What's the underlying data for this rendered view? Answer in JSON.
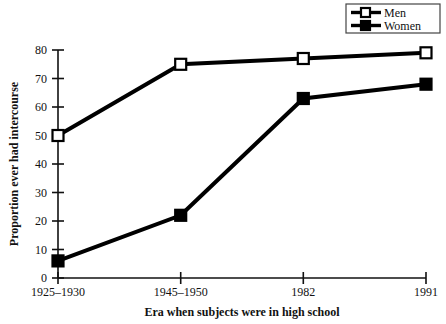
{
  "chart_data": {
    "type": "line",
    "title": "",
    "subtitle": "",
    "xlabel": "Era when subjects were in high school",
    "ylabel": "Proportion ever had intercourse",
    "categories": [
      "1925–1930",
      "1945–1950",
      "1982",
      "1991"
    ],
    "series": [
      {
        "name": "Men",
        "values": [
          50,
          75,
          77,
          79
        ],
        "marker": "open-square",
        "color": "#000000"
      },
      {
        "name": "Women",
        "values": [
          6,
          22,
          63,
          68
        ],
        "marker": "filled-square",
        "color": "#000000"
      }
    ],
    "ylim": [
      0,
      80
    ],
    "yticks": [
      0,
      10,
      20,
      30,
      40,
      50,
      60,
      70,
      80
    ],
    "ytick_labels": [
      "0",
      "10",
      "20",
      "30",
      "40",
      "50",
      "60",
      "70",
      "80"
    ],
    "grid": false,
    "legend_position": "top-right",
    "legend_entries": [
      "Men",
      "Women"
    ]
  },
  "axes": {
    "y_title": "Proportion ever had intercourse",
    "x_title": "Era when subjects were in high school",
    "y_tick_0": "0",
    "y_tick_10": "10",
    "y_tick_20": "20",
    "y_tick_30": "30",
    "y_tick_40": "40",
    "y_tick_50": "50",
    "y_tick_60": "60",
    "y_tick_70": "70",
    "y_tick_80": "80",
    "x_tick_0": "1925–1930",
    "x_tick_1": "1945–1950",
    "x_tick_2": "1982",
    "x_tick_3": "1991"
  },
  "legend": {
    "men_label": "Men",
    "women_label": "Women"
  }
}
